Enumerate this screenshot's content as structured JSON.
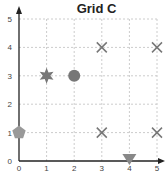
{
  "chart_data": {
    "type": "scatter",
    "title": "Grid C",
    "xlabel": "",
    "ylabel": "",
    "xlim": [
      0,
      5
    ],
    "ylim": [
      0,
      5
    ],
    "xticks": [
      "0",
      "1",
      "2",
      "3",
      "4",
      "5"
    ],
    "yticks": [
      "0",
      "1",
      "2",
      "3",
      "4",
      "5"
    ],
    "grid": true,
    "legend": null,
    "points": [
      {
        "x": 1,
        "y": 3,
        "marker": "star",
        "color": "#777777"
      },
      {
        "x": 2,
        "y": 3,
        "marker": "circle",
        "color": "#777777"
      },
      {
        "x": 3,
        "y": 4,
        "marker": "x",
        "color": "#777777"
      },
      {
        "x": 5,
        "y": 4,
        "marker": "x",
        "color": "#777777"
      },
      {
        "x": 0,
        "y": 1,
        "marker": "pentagon",
        "color": "#999999"
      },
      {
        "x": 3,
        "y": 1,
        "marker": "x",
        "color": "#777777"
      },
      {
        "x": 5,
        "y": 1,
        "marker": "x",
        "color": "#777777"
      },
      {
        "x": 4,
        "y": 0,
        "marker": "triangle-down",
        "color": "#888888"
      }
    ]
  }
}
